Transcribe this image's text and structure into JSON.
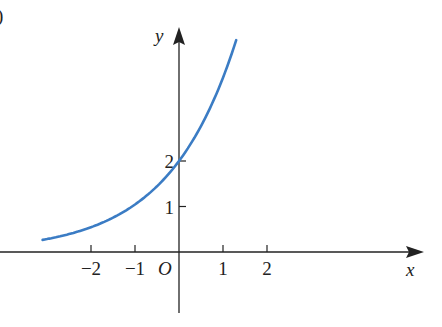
{
  "figure": {
    "label": ")"
  },
  "chart_data": {
    "type": "line",
    "title": "",
    "xlabel": "x",
    "ylabel": "y",
    "origin_label": "O",
    "x_ticks": [
      -2,
      -1,
      1,
      2
    ],
    "x_tick_labels": [
      "−2",
      "−1",
      "1",
      "2"
    ],
    "y_ticks": [
      1,
      2
    ],
    "y_tick_labels": [
      "1",
      "2"
    ],
    "xlim": [
      -3.3,
      5.5
    ],
    "ylim": [
      -1.4,
      5.0
    ],
    "grid": false,
    "legend": null,
    "series": [
      {
        "name": "exponential curve",
        "color": "#3b7cc4",
        "x": [
          -3.1,
          -2.5,
          -2.0,
          -1.5,
          -1.0,
          -0.5,
          0.0,
          0.5,
          1.0,
          1.3
        ],
        "y": [
          0.27,
          0.39,
          0.55,
          0.75,
          1.04,
          1.45,
          2.0,
          2.77,
          3.83,
          4.67
        ]
      }
    ],
    "annotations": [
      "y-intercept at 2"
    ]
  },
  "colors": {
    "curve": "#3b7cc4",
    "axis": "#222222"
  }
}
